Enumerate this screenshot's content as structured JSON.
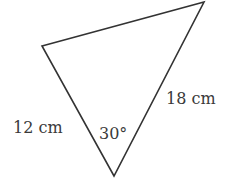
{
  "figure": {
    "type": "triangle",
    "sides": [
      {
        "label": "12 cm",
        "length_cm": 12
      },
      {
        "label": "18 cm",
        "length_cm": 18
      }
    ],
    "angle": {
      "label": "30°",
      "degrees": 30
    },
    "stroke_color": "#333333"
  }
}
